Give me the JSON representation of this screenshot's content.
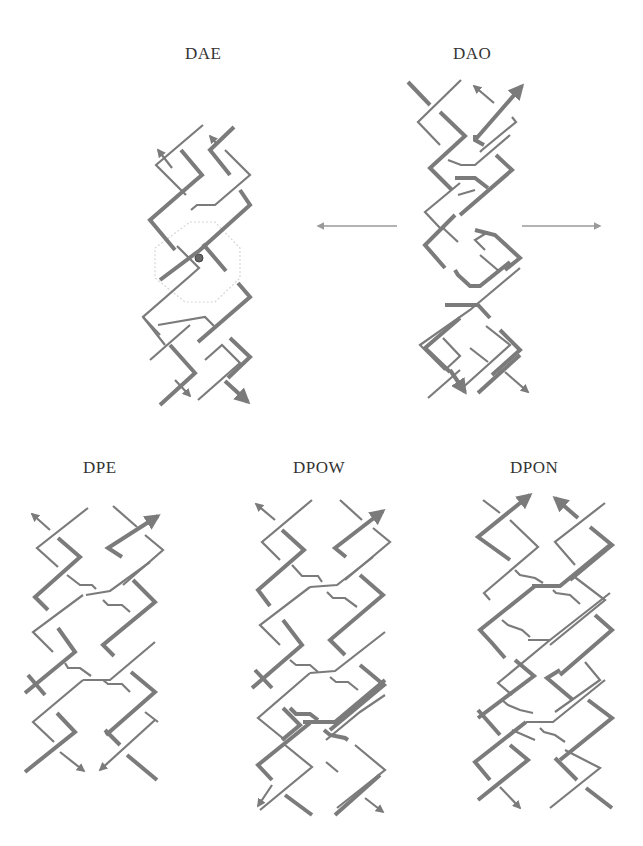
{
  "figure": {
    "panels": [
      {
        "id": "dae",
        "label": "DAE"
      },
      {
        "id": "dao",
        "label": "DAO"
      },
      {
        "id": "dpe",
        "label": "DPE"
      },
      {
        "id": "dpow",
        "label": "DPOW"
      },
      {
        "id": "dpon",
        "label": "DPON"
      }
    ],
    "annotations": {
      "dae_center_marker": "dyad-axis-dot",
      "dae_dotted_outline": "hexagon",
      "dao_side_arrows": [
        "left",
        "right"
      ]
    },
    "colors": {
      "strand": "#7b7b7b",
      "marker": "#666666",
      "dotted_outline": "#d6d6d6",
      "side_arrow": "#9a9a9a",
      "label_text": "#333333",
      "background": "#ffffff"
    }
  }
}
